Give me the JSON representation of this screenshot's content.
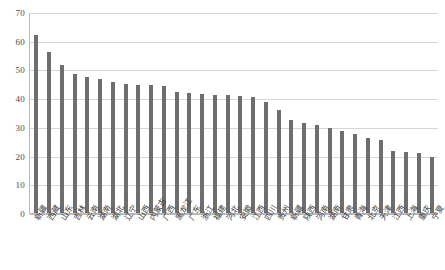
{
  "chart_data": {
    "type": "bar",
    "title": "",
    "subtitle": "",
    "xlabel": "",
    "ylabel": "",
    "ylim": [
      0,
      70
    ],
    "yticks": [
      0,
      10,
      20,
      30,
      40,
      50,
      60,
      70
    ],
    "ytick_labels": [
      "0",
      "10",
      "20",
      "30",
      "40",
      "50",
      "60",
      "70"
    ],
    "grid": true,
    "legend": false,
    "legend_position": "none",
    "bar_color": "#6e6e6e",
    "gridline_color": "#d6d6d6",
    "axis_color": "#b9b9b9",
    "background_color": "#ffffff",
    "categories": [
      "新疆",
      "西藏",
      "山东",
      "吉林",
      "云南",
      "湖南",
      "湖北",
      "辽宁",
      "山西",
      "内蒙古",
      "广西",
      "黑龙江",
      "广东",
      "浙江",
      "福建",
      "河北",
      "安徽",
      "江西",
      "四川",
      "贵州",
      "新疆",
      "陕西",
      "河南",
      "湖南",
      "甘肃",
      "青海",
      "北京",
      "天津",
      "江西",
      "上海",
      "重庆",
      "宁夏"
    ],
    "values": [
      62.0,
      56.0,
      51.5,
      48.5,
      47.5,
      46.5,
      45.5,
      45.0,
      44.5,
      44.5,
      44.3,
      42.2,
      41.8,
      41.5,
      41.2,
      41.0,
      40.7,
      40.3,
      38.5,
      35.8,
      32.5,
      31.5,
      30.5,
      29.5,
      28.5,
      27.5,
      26.0,
      25.5,
      21.5,
      21.3,
      21.0,
      19.5
    ]
  }
}
